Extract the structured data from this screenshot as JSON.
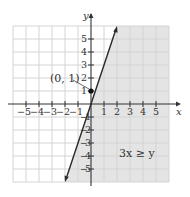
{
  "figure": {
    "x_axis_label": "x",
    "y_axis_label": "y",
    "x_ticks": [
      "−5",
      "−4",
      "−3",
      "−2",
      "−1",
      "1",
      "2",
      "3",
      "4",
      "5"
    ],
    "y_ticks_pos": [
      "5",
      "4",
      "3",
      "2",
      "1"
    ],
    "y_ticks_neg": [
      "1",
      "2",
      "3",
      "4",
      "5"
    ],
    "point_label": "(0, 1)",
    "inequality_label": "3x ≥ y",
    "colors": {
      "shade": "#e4e4e4",
      "grid_unshaded": "#dadada",
      "grid_shaded": "#cdcdcd",
      "axis": "#333333",
      "line": "#2a2a2a"
    }
  }
}
